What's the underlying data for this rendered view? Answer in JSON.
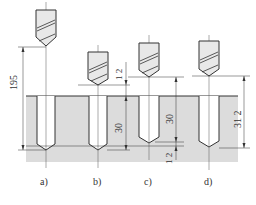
{
  "figure": {
    "panels": [
      {
        "label": "a)",
        "dimension": "195"
      },
      {
        "label": "b)",
        "dimension_top": "1.2",
        "dimension_depth": "30"
      },
      {
        "label": "c)",
        "dimension_depth": "30",
        "dimension_bottom": "1.2"
      },
      {
        "label": "d)",
        "dimension_depth": "31.2"
      }
    ],
    "dimension_texts": {
      "a_total": "195",
      "b_clearance": "1 2",
      "b_depth": "30",
      "c_depth": "30",
      "c_extra": "1 2",
      "d_depth": "31 2"
    },
    "caption": "",
    "colors": {
      "workpiece": "#dcdcdc",
      "line": "#333333",
      "drill_fill": "#e8e8e8"
    }
  }
}
